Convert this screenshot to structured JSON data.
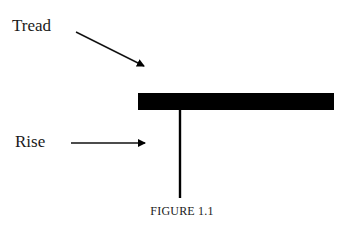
{
  "diagram": {
    "labels": {
      "tread": "Tread",
      "rise": "Rise"
    },
    "caption": "FIGURE 1.1",
    "colors": {
      "ink": "#000000",
      "text": "#1a1a1a",
      "background": "#ffffff"
    },
    "shapes": {
      "tread_bar": {
        "x": 138,
        "y": 93,
        "width": 196,
        "height": 17
      },
      "rise_line": {
        "x": 180,
        "y1": 110,
        "y2": 198
      },
      "tread_arrow": {
        "from": [
          76,
          32
        ],
        "to": [
          145,
          66
        ]
      },
      "rise_arrow": {
        "from": [
          71,
          143
        ],
        "to": [
          146,
          143
        ]
      }
    }
  }
}
